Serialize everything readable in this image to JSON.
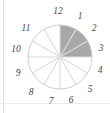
{
  "chart_data": {
    "type": "pie",
    "title": "",
    "xlabel": "",
    "ylabel": "",
    "legend_position": "none",
    "grid": false,
    "slice_count": 12,
    "slice_degrees": 30,
    "start_angle_deg": 0,
    "direction": "clockwise",
    "categories": [
      "12",
      "1",
      "2",
      "3",
      "4",
      "5",
      "6",
      "7",
      "8",
      "9",
      "10",
      "11"
    ],
    "values": [
      1,
      1,
      1,
      1,
      1,
      1,
      1,
      1,
      1,
      1,
      1,
      1
    ],
    "shaded_slices": [
      "12",
      "1",
      "2"
    ],
    "shaded_range_label": "12 to 3",
    "shaded_fraction": "3/12",
    "colors": {
      "shaded": "#a8a8a8",
      "unshaded": "#ffffff",
      "outline": "#cfcfcf",
      "spoke": "#dcdcdc",
      "label": "#4a4a4a",
      "background": "#ffffff",
      "rule": "#e2e2e2"
    },
    "geometry": {
      "center_x": 60,
      "center_y": 57,
      "radius": 32,
      "label_radius": 43
    }
  },
  "labels": [
    {
      "text": "12",
      "x": 58,
      "y": 12
    },
    {
      "text": "1",
      "x": 80,
      "y": 17
    },
    {
      "text": "2",
      "x": 94,
      "y": 29
    },
    {
      "text": "3",
      "x": 101,
      "y": 49
    },
    {
      "text": "4",
      "x": 100,
      "y": 71
    },
    {
      "text": "5",
      "x": 90,
      "y": 90
    },
    {
      "text": "6",
      "x": 71,
      "y": 101
    },
    {
      "text": "7",
      "x": 51,
      "y": 102
    },
    {
      "text": "8",
      "x": 31,
      "y": 93
    },
    {
      "text": "9",
      "x": 18,
      "y": 74
    },
    {
      "text": "10",
      "x": 16,
      "y": 50
    },
    {
      "text": "11",
      "x": 26,
      "y": 29
    }
  ]
}
